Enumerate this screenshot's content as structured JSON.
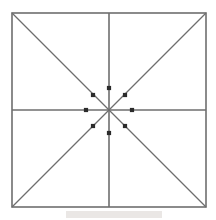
{
  "figure": {
    "canvas": {
      "width": 216,
      "height": 220,
      "background": "#ffffff"
    },
    "square": {
      "label": "outer-square",
      "x": 12,
      "y": 13,
      "width": 194,
      "height": 194,
      "stroke": "#6e6e6e",
      "stroke_width": 1.6
    },
    "center": {
      "label": "center-point",
      "x": 109,
      "y": 110
    },
    "lines": [
      {
        "name": "horizontal-midline",
        "x1": 12,
        "y1": 110,
        "x2": 206,
        "y2": 110,
        "stroke": "#6e6e6e",
        "stroke_width": 1.6
      },
      {
        "name": "vertical-midline",
        "x1": 109,
        "y1": 13,
        "x2": 109,
        "y2": 207,
        "stroke": "#6e6e6e",
        "stroke_width": 1.6
      },
      {
        "name": "diagonal-tl-br",
        "x1": 12,
        "y1": 13,
        "x2": 206,
        "y2": 207,
        "stroke": "#6e6e6e",
        "stroke_width": 1.3
      },
      {
        "name": "diagonal-tr-bl",
        "x1": 206,
        "y1": 13,
        "x2": 12,
        "y2": 207,
        "stroke": "#6e6e6e",
        "stroke_width": 1.3
      }
    ],
    "points": {
      "count": 8,
      "marker": {
        "shape": "square",
        "size": 4.2,
        "fill": "#2b2b2b"
      },
      "radius_axis": 23,
      "radius_diagonal": 22,
      "items": [
        {
          "name": "point-north",
          "direction": "N",
          "angle_deg": 90,
          "x": 109,
          "y": 88
        },
        {
          "name": "point-northeast",
          "direction": "NE",
          "angle_deg": 45,
          "x": 125,
          "y": 95
        },
        {
          "name": "point-east",
          "direction": "E",
          "angle_deg": 0,
          "x": 132,
          "y": 110
        },
        {
          "name": "point-southeast",
          "direction": "SE",
          "angle_deg": 315,
          "x": 125,
          "y": 126
        },
        {
          "name": "point-south",
          "direction": "S",
          "angle_deg": 270,
          "x": 109,
          "y": 133
        },
        {
          "name": "point-southwest",
          "direction": "SW",
          "angle_deg": 225,
          "x": 93,
          "y": 126
        },
        {
          "name": "point-west",
          "direction": "W",
          "angle_deg": 180,
          "x": 86,
          "y": 110
        },
        {
          "name": "point-northwest",
          "direction": "NW",
          "angle_deg": 135,
          "x": 93,
          "y": 95
        }
      ]
    },
    "artifact": {
      "name": "scan-smudge",
      "x": 66,
      "y": 211,
      "width": 96,
      "height": 7,
      "color": "#d8d4d0"
    }
  }
}
